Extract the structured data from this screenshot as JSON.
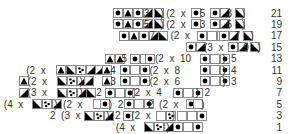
{
  "symbols": {
    "D": "dot",
    "T": "triangle-up",
    "R": "lower-right-triangle",
    "L": "upper-left-triangle",
    "C": "cluster-dots",
    "E": "empty"
  },
  "row_numbers": [
    "21",
    "19",
    "17",
    "15",
    "13",
    "11",
    "9",
    "7",
    "5",
    "3",
    "1"
  ],
  "rows": [
    {
      "row": "21",
      "segments": [
        {
          "type": "cells",
          "col": 16,
          "cells": [
            "D",
            "T",
            "D",
            "R"
          ]
        },
        {
          "type": "text",
          "col": 20.4,
          "text": "3"
        },
        {
          "type": "cells",
          "col": 21.8,
          "cells": [
            "L"
          ]
        },
        {
          "type": "text",
          "col": 22.8,
          "text": ")"
        },
        {
          "type": "text",
          "col": 23.6,
          "text": "(2  x"
        },
        {
          "type": "cells",
          "col": 27.2,
          "cells": [
            "D"
          ]
        },
        {
          "type": "text",
          "col": 28.4,
          "text": "5"
        },
        {
          "type": "cells",
          "col": 29.8,
          "cells": [
            "D",
            "R"
          ]
        },
        {
          "type": "text",
          "col": 32.2,
          "text": "3"
        },
        {
          "type": "cells",
          "col": 33.4,
          "cells": [
            "L"
          ]
        },
        {
          "type": "text",
          "col": 34.4,
          "text": ")"
        }
      ]
    },
    {
      "row": "19",
      "segments": [
        {
          "type": "cells",
          "col": 16,
          "cells": [
            "D",
            "T",
            "D",
            "R"
          ]
        },
        {
          "type": "text",
          "col": 20.4,
          "text": "5"
        },
        {
          "type": "cells",
          "col": 21.8,
          "cells": [
            "L"
          ]
        },
        {
          "type": "text",
          "col": 22.8,
          "text": ")"
        },
        {
          "type": "text",
          "col": 23.6,
          "text": "(2  x"
        },
        {
          "type": "cells",
          "col": 27.2,
          "cells": [
            "D"
          ]
        },
        {
          "type": "text",
          "col": 28.4,
          "text": "3"
        },
        {
          "type": "cells",
          "col": 29.8,
          "cells": [
            "D",
            "R"
          ]
        },
        {
          "type": "text",
          "col": 32.2,
          "text": "5"
        },
        {
          "type": "cells",
          "col": 33.4,
          "cells": [
            "L"
          ]
        },
        {
          "type": "text",
          "col": 34.4,
          "text": ")"
        }
      ]
    },
    {
      "row": "17",
      "segments": [
        {
          "type": "cells",
          "col": 16.8,
          "cells": [
            "D",
            "T",
            "D",
            "R"
          ]
        },
        {
          "type": "text",
          "col": 21.2,
          "text": "7"
        },
        {
          "type": "cells",
          "col": 22.4,
          "cells": [
            "L"
          ]
        },
        {
          "type": "text",
          "col": 24.2,
          "text": "(2  x"
        },
        {
          "type": "cells",
          "col": 28,
          "cells": [
            "D",
            "E",
            "E"
          ]
        },
        {
          "type": "cells",
          "col": 31.2,
          "cells": [
            "D",
            "R"
          ]
        },
        {
          "type": "text",
          "col": 33.4,
          "text": "7"
        },
        {
          "type": "cells",
          "col": 34.6,
          "cells": [
            "L"
          ]
        },
        {
          "type": "text",
          "col": 35.6,
          "text": ")"
        }
      ]
    },
    {
      "row": "15",
      "segments": [
        {
          "type": "cells",
          "col": 26.4,
          "cells": [
            "D",
            "R"
          ]
        },
        {
          "type": "text",
          "col": 29,
          "text": "(3  x"
        },
        {
          "type": "cells",
          "col": 32.4,
          "cells": [
            "D",
            "R"
          ]
        },
        {
          "type": "text",
          "col": 34.6,
          "text": "9"
        },
        {
          "type": "cells",
          "col": 35.6,
          "cells": [
            "L"
          ]
        },
        {
          "type": "text",
          "col": 36.6,
          "text": ")"
        }
      ]
    },
    {
      "row": "13",
      "segments": [
        {
          "type": "cells",
          "col": 14.8,
          "cells": [
            "T",
            "T"
          ]
        },
        {
          "type": "text",
          "col": 17.2,
          "text": "5"
        },
        {
          "type": "cells",
          "col": 18.4,
          "cells": [
            "D",
            "E"
          ]
        },
        {
          "type": "cells",
          "col": 20.6,
          "cells": [
            "D"
          ]
        },
        {
          "type": "text",
          "col": 22,
          "text": "(2  x  10"
        },
        {
          "type": "cells",
          "col": 28.4,
          "cells": [
            "D",
            "E",
            "D"
          ]
        },
        {
          "type": "text",
          "col": 31.6,
          "text": ")  5"
        }
      ]
    },
    {
      "row": "11",
      "segments": [
        {
          "type": "text",
          "col": 3.6,
          "text": "(2  x"
        },
        {
          "type": "cells",
          "col": 7.8,
          "cells": [
            "T",
            "L",
            "C",
            "R",
            "T"
          ]
        },
        {
          "type": "cells",
          "col": 13.4,
          "cells": [
            "R"
          ]
        },
        {
          "type": "cells",
          "col": 14.4,
          "cells": [
            "T"
          ]
        },
        {
          "type": "text",
          "col": 15.6,
          "text": "4"
        },
        {
          "type": "cells",
          "col": 17,
          "cells": [
            "D",
            "E",
            "D"
          ]
        },
        {
          "type": "text",
          "col": 21.2,
          "text": "(2  x  8"
        },
        {
          "type": "cells",
          "col": 28.4,
          "cells": [
            "D",
            "E",
            "D"
          ]
        },
        {
          "type": "text",
          "col": 31.6,
          "text": ")  4"
        }
      ]
    },
    {
      "row": "9",
      "segments": [
        {
          "type": "cells",
          "col": 2.6,
          "cells": [
            "T"
          ]
        },
        {
          "type": "text",
          "col": 3.8,
          "text": "(2  x"
        },
        {
          "type": "cells",
          "col": 8,
          "cells": [
            "L",
            "C",
            "R"
          ]
        },
        {
          "type": "text",
          "col": 11.2,
          "text": ")"
        },
        {
          "type": "cells",
          "col": 11.8,
          "cells": [
            "R"
          ]
        },
        {
          "type": "cells",
          "col": 14.4,
          "cells": [
            "T"
          ]
        },
        {
          "type": "text",
          "col": 15.6,
          "text": "3"
        },
        {
          "type": "cells",
          "col": 17,
          "cells": [
            "D",
            "E",
            "D"
          ]
        },
        {
          "type": "text",
          "col": 21.2,
          "text": "(2  x  6"
        },
        {
          "type": "cells",
          "col": 28.4,
          "cells": [
            "D",
            "E",
            "D"
          ]
        },
        {
          "type": "text",
          "col": 31.6,
          "text": ")  3"
        }
      ]
    },
    {
      "row": "7",
      "segments": [
        {
          "type": "cells",
          "col": 2.6,
          "cells": [
            "R"
          ]
        },
        {
          "type": "text",
          "col": 3.8,
          "text": "(3  x"
        },
        {
          "type": "cells",
          "col": 8,
          "cells": [
            "L",
            "C",
            "R"
          ]
        },
        {
          "type": "text",
          "col": 11.2,
          "text": ")"
        },
        {
          "type": "cells",
          "col": 12.2,
          "cells": [
            "L"
          ]
        },
        {
          "type": "text",
          "col": 13.6,
          "text": "2"
        },
        {
          "type": "cells",
          "col": 14.8,
          "cells": [
            "D",
            "E",
            "D"
          ]
        },
        {
          "type": "text",
          "col": 18.6,
          "text": "(2  x  4"
        },
        {
          "type": "cells",
          "col": 24.6,
          "cells": [
            "D",
            "E",
            "D"
          ]
        },
        {
          "type": "text",
          "col": 27.8,
          "text": ")  2"
        }
      ]
    },
    {
      "row": "5",
      "segments": [
        {
          "type": "text",
          "col": 0.4,
          "text": "(4  x"
        },
        {
          "type": "cells",
          "col": 4.4,
          "cells": [
            "L",
            "C",
            "R"
          ]
        },
        {
          "type": "text",
          "col": 7.6,
          "text": ")  (2  x"
        },
        {
          "type": "cells",
          "col": 13.2,
          "cells": [
            "E"
          ]
        },
        {
          "type": "cells",
          "col": 14.2,
          "cells": [
            "D"
          ]
        },
        {
          "type": "text",
          "col": 15.4,
          "text": ")  2"
        },
        {
          "type": "cells",
          "col": 17.6,
          "cells": [
            "D",
            "E",
            "D"
          ]
        },
        {
          "type": "text",
          "col": 21,
          "text": "2  (2  x"
        },
        {
          "type": "cells",
          "col": 26.4,
          "cells": [
            "D"
          ]
        },
        {
          "type": "cells",
          "col": 27.4,
          "cells": [
            "E"
          ]
        },
        {
          "type": "text",
          "col": 28.6,
          "text": ")"
        }
      ]
    },
    {
      "row": "3",
      "segments": [
        {
          "type": "text",
          "col": 7,
          "text": "2  (3  x"
        },
        {
          "type": "cells",
          "col": 11.8,
          "cells": [
            "L",
            "C",
            "R"
          ]
        },
        {
          "type": "text",
          "col": 15,
          "text": ")  2"
        },
        {
          "type": "cells",
          "col": 17.4,
          "cells": [
            "D"
          ]
        },
        {
          "type": "text",
          "col": 18.6,
          "text": "(2  x"
        },
        {
          "type": "cells",
          "col": 22.2,
          "cells": [
            "E",
            "C"
          ]
        },
        {
          "type": "text",
          "col": 24.4,
          "text": ")"
        },
        {
          "type": "cells",
          "col": 25.2,
          "cells": [
            "E",
            "E",
            "D"
          ]
        }
      ]
    },
    {
      "row": "1",
      "segments": [
        {
          "type": "text",
          "col": 16.4,
          "text": "(4  x"
        },
        {
          "type": "cells",
          "col": 20.4,
          "cells": [
            "L",
            "C",
            "R"
          ]
        },
        {
          "type": "text",
          "col": 23.6,
          "text": ")"
        },
        {
          "type": "cells",
          "col": 24.6,
          "cells": [
            "D",
            "E",
            "D"
          ]
        }
      ]
    }
  ]
}
